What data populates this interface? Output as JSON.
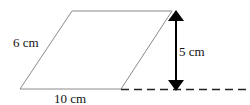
{
  "diagram": {
    "shape": "parallelogram",
    "labels": {
      "side": "6 cm",
      "base": "10 cm",
      "height": "5 cm"
    },
    "colors": {
      "outline": "#888888",
      "arrow": "#000000",
      "dashed": "#222222",
      "text": "#111111"
    }
  }
}
